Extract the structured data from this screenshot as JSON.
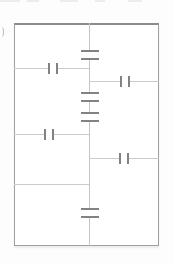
{
  "title": "",
  "colors": {
    "page_bg": "#fdfdfd",
    "frame_fill": "#ffffff",
    "frame_border": "#a0a0a0",
    "frame_border_top": "#8c8c8c",
    "wire": "#cbcbcb",
    "bus": "#c4c4c4",
    "plate": "#828282",
    "mask": "#ffffff",
    "artifact": "#ececec",
    "fragment": "#b8b8b8"
  },
  "canvas": {
    "width": 173,
    "height": 265
  },
  "schematic": {
    "kind": "capacitor-network-circuit",
    "frame": {
      "x": 14,
      "y": 23,
      "width": 145,
      "height": 223
    },
    "bus": {
      "x": 89,
      "y1": 23,
      "y2": 246
    },
    "wires": [
      {
        "id": "wire-upper-left",
        "y": 68,
        "x1": 14,
        "x2": 89
      },
      {
        "id": "wire-upper-right",
        "y": 81,
        "x1": 89,
        "x2": 159
      },
      {
        "id": "wire-middle-left",
        "y": 134,
        "x1": 14,
        "x2": 89
      },
      {
        "id": "wire-middle-right",
        "y": 158,
        "x1": 89,
        "x2": 159
      },
      {
        "id": "wire-lower-left",
        "y": 184,
        "x1": 14,
        "x2": 89
      }
    ],
    "capacitors": [
      {
        "id": "cap-upper-left",
        "plates": "vertical",
        "cx": 53,
        "cy": 68
      },
      {
        "id": "cap-upper-right",
        "plates": "vertical",
        "cx": 125,
        "cy": 81
      },
      {
        "id": "cap-middle-left",
        "plates": "vertical",
        "cx": 49,
        "cy": 134
      },
      {
        "id": "cap-middle-right",
        "plates": "vertical",
        "cx": 124,
        "cy": 158
      },
      {
        "id": "cap-bus-top",
        "plates": "horizontal",
        "cx": 89,
        "cy": 55
      },
      {
        "id": "cap-bus-mid-1",
        "plates": "horizontal",
        "cx": 89,
        "cy": 97
      },
      {
        "id": "cap-bus-mid-2",
        "plates": "horizontal",
        "cx": 89,
        "cy": 117
      },
      {
        "id": "cap-bus-bottom",
        "plates": "horizontal",
        "cx": 89,
        "cy": 213
      }
    ],
    "plate_style": {
      "gap": 8,
      "length_vertical": 11,
      "length_horizontal": 18,
      "thickness": 2
    }
  },
  "artifacts": {
    "top_smudges": [
      {
        "x": 0,
        "w": 20
      },
      {
        "x": 27,
        "w": 12
      },
      {
        "x": 60,
        "w": 18
      },
      {
        "x": 95,
        "w": 10
      },
      {
        "x": 128,
        "w": 14
      }
    ],
    "left_fragment": {
      "x": 0,
      "y": 27,
      "width": 3,
      "height": 10
    }
  }
}
